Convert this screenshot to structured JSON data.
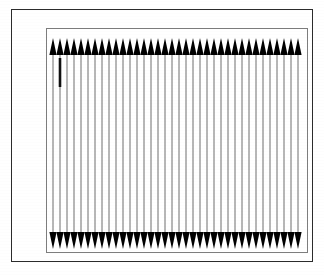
{
  "figure": {
    "domain_kind": "diagram",
    "background_color": "#ffffff",
    "outer_frame_color": "#2b2b2b",
    "inner_frame_color": "#7d7d7d",
    "line_color": "#6f6f6f",
    "arrow_color": "#000000",
    "highlight_color": "#111111"
  },
  "chart_data": {
    "type": "line",
    "title": "",
    "subtitle": "",
    "xlabel": "",
    "ylabel": "",
    "grid": false,
    "legend": "none",
    "series_count": 36,
    "line_count": 36,
    "arrowheads_top": 36,
    "arrowheads_bottom": 36,
    "arrow_direction_top": "up",
    "arrow_direction_bottom": "down",
    "x_positions": [
      6,
      13,
      20,
      27,
      34,
      41,
      48,
      55,
      62,
      69,
      76,
      83,
      90,
      97,
      104,
      111,
      118,
      125,
      132,
      139,
      146,
      153,
      160,
      167,
      174,
      181,
      188,
      195,
      202,
      209,
      216,
      223,
      230,
      237,
      244,
      251
    ],
    "xlim": [
      0,
      262
    ],
    "ylim": [
      0,
      225
    ],
    "line_top_y": 26,
    "line_bottom_y": 205,
    "arrow_top_tip_y": 9,
    "arrow_top_base_y": 26,
    "arrow_bottom_base_y": 203,
    "arrow_bottom_tip_y": 220,
    "arrow_half_width": 3.6,
    "highlight": {
      "line_index": 1,
      "x": 13,
      "y_start": 29,
      "y_end": 58,
      "stroke_width": 2.6,
      "note": "thickened dark segment near top of second line"
    }
  },
  "labels": {
    "figure_caption": "",
    "axis_ticks_x": [],
    "axis_ticks_y": []
  }
}
